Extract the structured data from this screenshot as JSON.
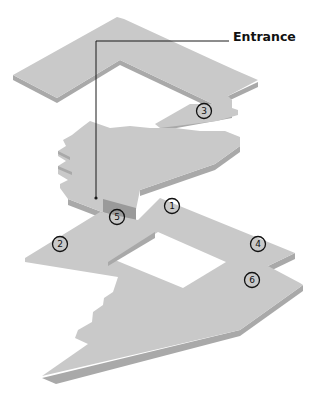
{
  "diagram": {
    "type": "exploded isometric floor plan",
    "levels": [
      "upper",
      "middle",
      "lower"
    ],
    "colors": {
      "floor_top": "#c9c9c9",
      "floor_edge": "#a9a9a9",
      "line": "#1a1a1a",
      "background": "#ffffff"
    },
    "callout": {
      "label": "Entrance"
    },
    "markers": [
      {
        "id": "1",
        "label": "1",
        "x": 172,
        "y": 206
      },
      {
        "id": "2",
        "label": "2",
        "x": 60,
        "y": 244
      },
      {
        "id": "3",
        "label": "3",
        "x": 204,
        "y": 111
      },
      {
        "id": "4",
        "label": "4",
        "x": 258,
        "y": 244
      },
      {
        "id": "5",
        "label": "5",
        "x": 117,
        "y": 217
      },
      {
        "id": "6",
        "label": "6",
        "x": 252,
        "y": 280
      }
    ]
  }
}
